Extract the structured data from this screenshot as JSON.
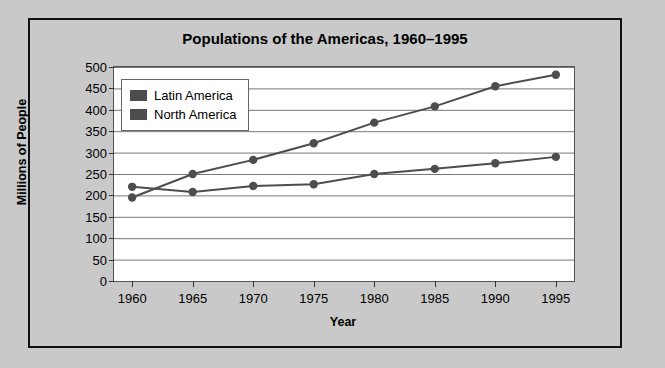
{
  "chart_data": {
    "type": "line",
    "title": "Populations of the Americas, 1960–1995",
    "xlabel": "Year",
    "ylabel": "Millions of People",
    "categories": [
      "1960",
      "1965",
      "1970",
      "1975",
      "1980",
      "1985",
      "1990",
      "1995"
    ],
    "x": [
      1960,
      1965,
      1970,
      1975,
      1980,
      1985,
      1990,
      1995
    ],
    "series": [
      {
        "name": "Latin America",
        "color": "#4d4d4d",
        "values": [
          195,
          250,
          283,
          322,
          370,
          408,
          455,
          482
        ]
      },
      {
        "name": "North America",
        "color": "#4d4d4d",
        "values": [
          220,
          208,
          222,
          226,
          250,
          262,
          275,
          290
        ]
      }
    ],
    "ylim": [
      0,
      500
    ],
    "yticks": [
      0,
      50,
      100,
      150,
      200,
      250,
      300,
      350,
      400,
      450,
      500
    ],
    "ytick_labels": [
      "0",
      "50",
      "100",
      "150",
      "200",
      "250",
      "300",
      "350",
      "400",
      "450",
      "500"
    ],
    "xlim": [
      1958.5,
      1996.5
    ],
    "grid": "horizontal",
    "legend_position": "upper-left-inside",
    "marker": "circle",
    "background": "#ffffff",
    "figure_background": "#c9c9c9"
  },
  "legend": {
    "items": [
      {
        "label": "Latin America",
        "color": "#4d4d4d"
      },
      {
        "label": "North America",
        "color": "#4d4d4d"
      }
    ]
  }
}
